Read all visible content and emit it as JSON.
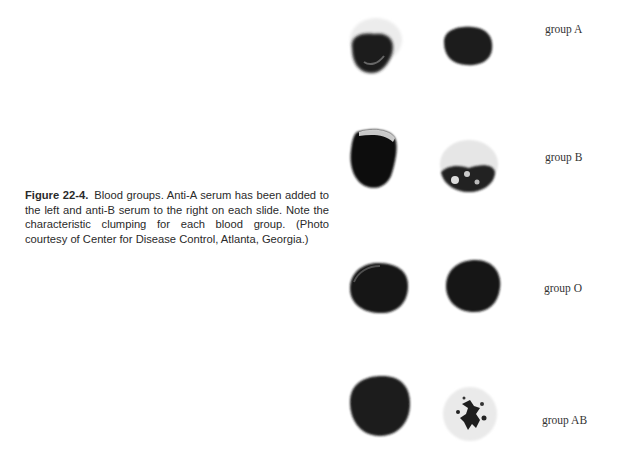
{
  "figure": {
    "number": "Figure 22-4.",
    "caption": "Blood groups. Anti-A serum has been added to the left and anti-B serum to the right on each slide. Note the characteristic clumping for each blood group. (Photo courtesy of Center for Disease Control, Atlanta, Georgia.)"
  },
  "rows": [
    {
      "label": "group A",
      "left": "clumped (anti-A)",
      "right": "uniform (anti-B)"
    },
    {
      "label": "group B",
      "left": "uniform (anti-A)",
      "right": "clumped (anti-B)"
    },
    {
      "label": "group O",
      "left": "uniform (anti-A)",
      "right": "uniform (anti-B)"
    },
    {
      "label": "group AB",
      "left": "clumped (anti-A)",
      "right": "clumped (anti-B)"
    }
  ]
}
